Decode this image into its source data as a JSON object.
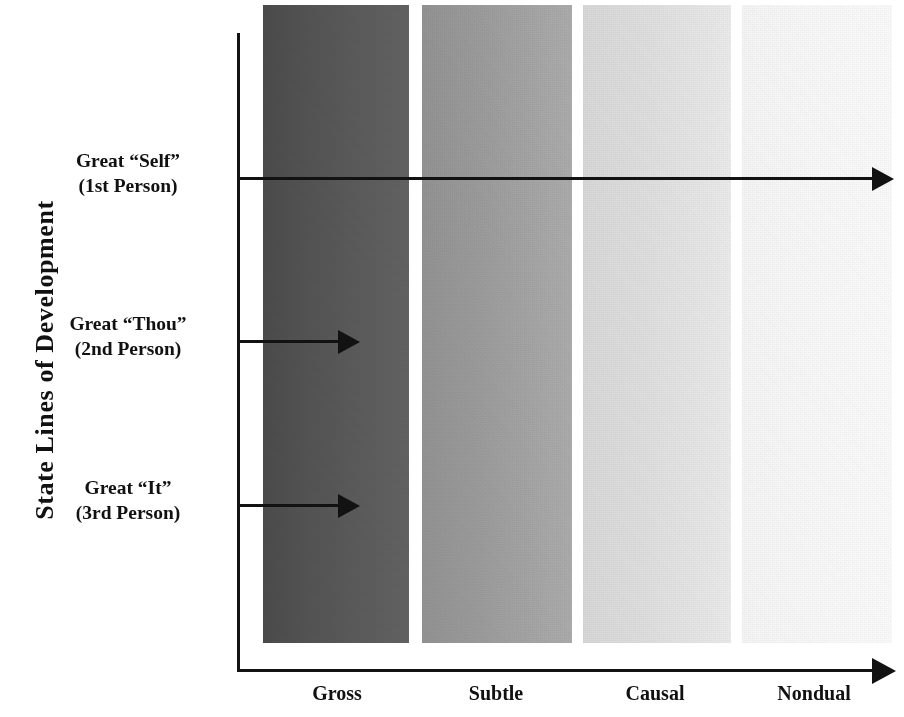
{
  "figure": {
    "y_axis_title": "State Lines of Development",
    "x_axis_title": ""
  },
  "chart_data": {
    "type": "heatmap",
    "title": "",
    "xlabel": "",
    "ylabel": "State Lines of Development",
    "grid": false,
    "legend": "none",
    "categories": [
      "Gross",
      "Subtle",
      "Causal",
      "Nondual"
    ],
    "band_fills": [
      "#555555",
      "#9d9d9d",
      "#e1e1e1",
      "#fafafa"
    ],
    "rows": [
      {
        "label_line1": "Great “Self”",
        "label_line2": "(1st Person)",
        "reach": "Nondual",
        "arrow_extent_categories": 4
      },
      {
        "label_line1": "Great “Thou”",
        "label_line2": "(2nd Person)",
        "reach": "Gross",
        "arrow_extent_categories": 1
      },
      {
        "label_line1": "Great “It”",
        "label_line2": "(3rd Person)",
        "reach": "Gross",
        "arrow_extent_categories": 1
      }
    ],
    "x_tick_labels": [
      "Gross",
      "Subtle",
      "Causal",
      "Nondual"
    ],
    "annotations": [
      "Great “Self” (1st Person) arrow spans all four state bands",
      "Great “Thou” (2nd Person) arrow stops within the Gross band",
      "Great “It” (3rd Person) arrow stops within the Gross band"
    ]
  },
  "rows": [
    {
      "line1": "Great “Self”",
      "line2": "(1st Person)"
    },
    {
      "line1": "Great “Thou”",
      "line2": "(2nd Person)"
    },
    {
      "line1": "Great “It”",
      "line2": "(3rd Person)"
    }
  ],
  "x_axis": {
    "ticks": [
      {
        "label": "Gross"
      },
      {
        "label": "Subtle"
      },
      {
        "label": "Causal"
      },
      {
        "label": "Nondual"
      }
    ]
  },
  "colors": {
    "ink": "#121212",
    "background": "#ffffff",
    "band_gross": "#555555",
    "band_subtle": "#9d9d9d",
    "band_causal": "#e1e1e1",
    "band_nondual": "#fafafa"
  }
}
